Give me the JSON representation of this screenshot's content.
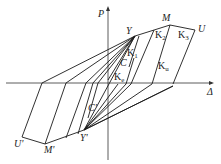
{
  "diagram": {
    "title": "",
    "axes": {
      "x_label": "Δ",
      "y_label": "P"
    },
    "points": {
      "Y": "Y",
      "M": "M",
      "U": "U",
      "Y_prime": "Y'",
      "M_prime": "M'",
      "U_prime": "U'",
      "C": "C",
      "C_prime": "C'"
    },
    "stiffness_labels": {
      "K1": "K",
      "K1_sub": "1",
      "K2": "K",
      "K2_sub": "2",
      "K3": "K",
      "K3_sub": "3",
      "Ke": "K",
      "Ke_sub": "e",
      "Ku": "K",
      "Ku_sub": "u"
    }
  }
}
